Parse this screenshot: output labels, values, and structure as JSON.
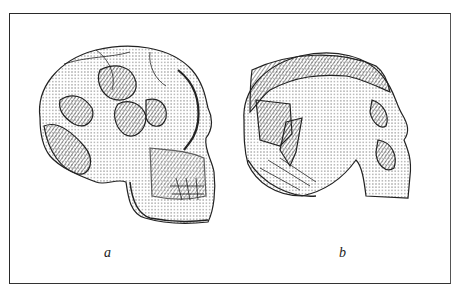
{
  "figure": {
    "panels": [
      {
        "id": "a",
        "label": "a",
        "subject": "skull-lateral-view-reconstructed",
        "facing": "right"
      },
      {
        "id": "b",
        "label": "b",
        "subject": "skull-lateral-view-fragments",
        "facing": "right"
      }
    ],
    "colors": {
      "ink": "#222222",
      "border": "#2a2a2a",
      "background": "#ffffff"
    }
  }
}
